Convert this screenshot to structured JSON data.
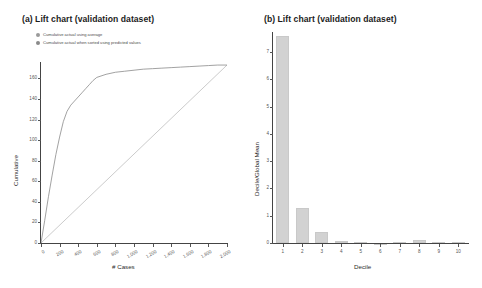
{
  "figure": {
    "panel_a": {
      "title": "(a) Lift chart (validation dataset)",
      "legend": [
        {
          "marker": "gray-dot",
          "color": "#9a9a9a",
          "label": "Cumulative actual using average"
        },
        {
          "marker": "gray-dot",
          "color": "#8a8a8a",
          "label": "Cumulative actual when sorted using predicted values"
        }
      ],
      "xlabel": "# Cases",
      "ylabel": "Cumulative"
    },
    "panel_b": {
      "title": "(b) Lift chart (validation dataset)",
      "xlabel": "Decile",
      "ylabel": "Decile/Global Mean"
    }
  },
  "chart_data": [
    {
      "type": "line",
      "title": "(a) Lift chart (validation dataset)",
      "xlabel": "# Cases",
      "ylabel": "Cumulative",
      "xlim": [
        0,
        2000
      ],
      "ylim": [
        0,
        175
      ],
      "xticks": [
        0,
        200,
        400,
        600,
        800,
        1000,
        1200,
        1400,
        1600,
        1800,
        2000
      ],
      "xtick_labels": [
        "0",
        "200",
        "400",
        "600",
        "800",
        "1,000",
        "1,200",
        "1,400",
        "1,600",
        "1,800",
        "2,000"
      ],
      "yticks": [
        0,
        20,
        40,
        60,
        80,
        100,
        120,
        140,
        160
      ],
      "ytick_labels": [
        "0",
        "20",
        "40",
        "60",
        "80",
        "100",
        "120",
        "140",
        "160"
      ],
      "grid": false,
      "legend_position": "above-plot-left",
      "series": [
        {
          "name": "Cumulative actual when sorted using predicted values",
          "color": "#8a8a8a",
          "x": [
            0,
            40,
            80,
            120,
            160,
            200,
            240,
            280,
            320,
            360,
            400,
            440,
            480,
            520,
            560,
            600,
            700,
            800,
            900,
            1000,
            1100,
            1200,
            1300,
            1400,
            1500,
            1600,
            1700,
            1800,
            1900,
            2000
          ],
          "y": [
            0,
            22,
            45,
            66,
            86,
            103,
            118,
            128,
            134,
            138,
            142,
            146,
            150,
            154,
            158,
            161,
            164,
            166,
            167,
            168,
            169,
            169.5,
            170,
            170.5,
            171,
            171.5,
            172,
            172.5,
            173,
            173
          ]
        },
        {
          "name": "Cumulative actual using average",
          "color": "#b0b0b0",
          "x": [
            0,
            2000
          ],
          "y": [
            0,
            173
          ]
        }
      ]
    },
    {
      "type": "bar",
      "title": "(b) Lift chart (validation dataset)",
      "xlabel": "Decile",
      "ylabel": "Decile/Global Mean",
      "categories": [
        "1",
        "2",
        "3",
        "4",
        "5",
        "6",
        "7",
        "8",
        "9",
        "10"
      ],
      "values": [
        7.6,
        1.3,
        0.42,
        0.08,
        0.02,
        0.015,
        0.03,
        0.1,
        0.05,
        0.02
      ],
      "ylim": [
        0,
        7.7
      ],
      "yticks": [
        0,
        1,
        2,
        3,
        4,
        5,
        6,
        7
      ],
      "ytick_labels": [
        "0",
        "1",
        "2",
        "3",
        "4",
        "5",
        "6",
        "7"
      ],
      "grid": false,
      "bar_color": "#d2d2d2"
    }
  ]
}
